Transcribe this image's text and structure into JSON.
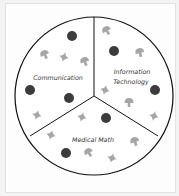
{
  "diagram": {
    "type": "pie-divided-circle",
    "sections": [
      {
        "label": "Communication",
        "lines": [
          "Communication"
        ]
      },
      {
        "label": "Information Technology",
        "lines": [
          "Information",
          "Technology"
        ]
      },
      {
        "label": "Medical Math",
        "lines": [
          "Medical Math"
        ]
      }
    ],
    "icons": [
      "dot-icon",
      "mushroom-icon",
      "star-icon"
    ],
    "colors": {
      "outline": "#111111",
      "dot": "#3c3c3c",
      "symbol": "#a6a6a6",
      "fill": "#ffffff"
    }
  }
}
